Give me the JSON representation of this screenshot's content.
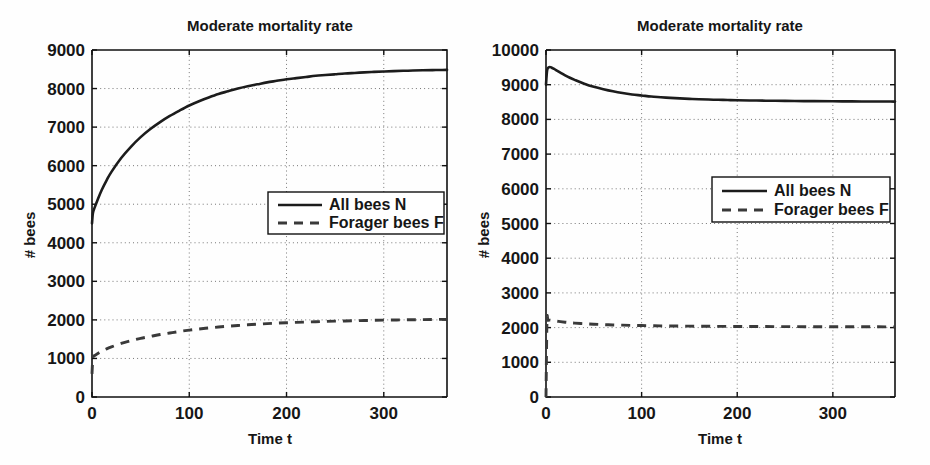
{
  "figure": {
    "background_color": "#fefefe",
    "foreground_color": "#161616",
    "panel_count": 2
  },
  "panels": [
    {
      "id": "left",
      "title": "Moderate mortality rate",
      "xlabel": "Time t",
      "ylabel": "# bees",
      "xticks": [
        "0",
        "100",
        "200",
        "300"
      ],
      "yticks": [
        "0",
        "1000",
        "2000",
        "3000",
        "4000",
        "5000",
        "6000",
        "7000",
        "8000",
        "9000"
      ],
      "legend": {
        "series_n_label": "All bees N",
        "series_f_label": "Forager bees F"
      }
    },
    {
      "id": "right",
      "title": "Moderate mortality rate",
      "xlabel": "Time t",
      "ylabel": "# bees",
      "xticks": [
        "0",
        "100",
        "200",
        "300"
      ],
      "yticks": [
        "0",
        "1000",
        "2000",
        "3000",
        "4000",
        "5000",
        "6000",
        "7000",
        "8000",
        "9000",
        "10000"
      ],
      "legend": {
        "series_n_label": "All bees N",
        "series_f_label": "Forager bees F"
      }
    }
  ],
  "chart_data": [
    {
      "type": "line",
      "panel": "left",
      "title": "Moderate mortality rate",
      "xlabel": "Time t",
      "ylabel": "# bees",
      "xlim": [
        0,
        365
      ],
      "ylim": [
        0,
        9000
      ],
      "xticks": [
        0,
        100,
        200,
        300
      ],
      "yticks": [
        0,
        1000,
        2000,
        3000,
        4000,
        5000,
        6000,
        7000,
        8000,
        9000
      ],
      "grid": true,
      "legend_position": "center-right",
      "series": [
        {
          "name": "All bees N",
          "style": "solid",
          "color": "#1c1c1c",
          "x": [
            0,
            1,
            3,
            6,
            10,
            15,
            20,
            30,
            40,
            50,
            60,
            70,
            80,
            90,
            100,
            110,
            120,
            130,
            140,
            150,
            160,
            170,
            180,
            190,
            200,
            210,
            220,
            230,
            240,
            250,
            260,
            270,
            280,
            290,
            300,
            310,
            320,
            330,
            340,
            350,
            360,
            365
          ],
          "y": [
            4500,
            4780,
            4930,
            5130,
            5370,
            5620,
            5840,
            6200,
            6490,
            6740,
            6950,
            7130,
            7290,
            7430,
            7560,
            7670,
            7770,
            7860,
            7930,
            8000,
            8060,
            8110,
            8160,
            8200,
            8240,
            8270,
            8300,
            8330,
            8350,
            8370,
            8390,
            8405,
            8420,
            8432,
            8443,
            8452,
            8460,
            8467,
            8473,
            8478,
            8483,
            8485
          ]
        },
        {
          "name": "Forager bees F",
          "style": "dashed",
          "color": "#3a3a3a",
          "x": [
            0,
            1,
            3,
            6,
            10,
            15,
            20,
            30,
            40,
            50,
            60,
            70,
            80,
            90,
            100,
            110,
            120,
            130,
            140,
            150,
            160,
            170,
            180,
            190,
            200,
            210,
            220,
            230,
            240,
            250,
            260,
            270,
            280,
            290,
            300,
            310,
            320,
            330,
            340,
            350,
            360,
            365
          ],
          "y": [
            600,
            1020,
            1080,
            1130,
            1190,
            1250,
            1300,
            1390,
            1460,
            1520,
            1570,
            1620,
            1660,
            1700,
            1735,
            1765,
            1790,
            1815,
            1835,
            1855,
            1872,
            1888,
            1902,
            1915,
            1926,
            1936,
            1945,
            1953,
            1960,
            1967,
            1973,
            1979,
            1984,
            1989,
            1993,
            1997,
            2001,
            2004,
            2007,
            2010,
            2013,
            2014
          ]
        }
      ]
    },
    {
      "type": "line",
      "panel": "right",
      "title": "Moderate mortality rate",
      "xlabel": "Time t",
      "ylabel": "# bees",
      "xlim": [
        0,
        365
      ],
      "ylim": [
        0,
        10000
      ],
      "xticks": [
        0,
        100,
        200,
        300
      ],
      "yticks": [
        0,
        1000,
        2000,
        3000,
        4000,
        5000,
        6000,
        7000,
        8000,
        9000,
        10000
      ],
      "grid": true,
      "legend_position": "center-right",
      "series": [
        {
          "name": "All bees N",
          "style": "solid",
          "color": "#1c1c1c",
          "x": [
            0,
            1,
            2,
            4,
            6,
            8,
            10,
            15,
            20,
            25,
            30,
            40,
            50,
            60,
            70,
            80,
            90,
            100,
            110,
            120,
            130,
            140,
            150,
            160,
            170,
            180,
            190,
            200,
            220,
            240,
            260,
            280,
            300,
            320,
            340,
            360,
            365
          ],
          "y": [
            9000,
            9380,
            9480,
            9510,
            9490,
            9460,
            9430,
            9350,
            9270,
            9200,
            9140,
            9030,
            8940,
            8870,
            8810,
            8760,
            8720,
            8690,
            8660,
            8640,
            8620,
            8605,
            8592,
            8580,
            8572,
            8565,
            8558,
            8552,
            8543,
            8536,
            8530,
            8526,
            8522,
            8519,
            8516,
            8514,
            8513
          ]
        },
        {
          "name": "Forager bees F",
          "style": "dashed",
          "color": "#3a3a3a",
          "x": [
            0,
            1,
            2,
            4,
            6,
            10,
            15,
            20,
            25,
            30,
            40,
            50,
            60,
            70,
            80,
            90,
            100,
            120,
            140,
            160,
            180,
            200,
            220,
            240,
            260,
            280,
            300,
            320,
            340,
            360,
            365
          ],
          "y": [
            0,
            2180,
            2210,
            2215,
            2205,
            2190,
            2172,
            2156,
            2142,
            2130,
            2112,
            2098,
            2086,
            2077,
            2070,
            2064,
            2059,
            2050,
            2044,
            2040,
            2036,
            2033,
            2031,
            2029,
            2027,
            2026,
            2025,
            2024,
            2023,
            2022,
            2022
          ]
        }
      ]
    }
  ]
}
